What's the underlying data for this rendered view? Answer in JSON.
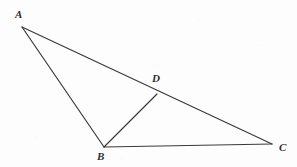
{
  "figure": {
    "kind": "geometry-diagram",
    "width": 297,
    "height": 167,
    "background_color": "#fdfdfd",
    "stroke_color": "#3a3a3a",
    "label_color": "#2e2e2e",
    "stroke_width": 1.2,
    "points": [
      {
        "id": "A",
        "label": "A",
        "x": 22,
        "y": 27,
        "label_x": 15,
        "label_y": 9
      },
      {
        "id": "B",
        "label": "B",
        "x": 104,
        "y": 147,
        "label_x": 97,
        "label_y": 151
      },
      {
        "id": "C",
        "label": "C",
        "x": 272,
        "y": 144,
        "label_x": 279,
        "label_y": 142
      },
      {
        "id": "D",
        "label": "D",
        "x": 157,
        "y": 94,
        "label_x": 152,
        "label_y": 73
      }
    ],
    "segments": [
      {
        "id": "AC",
        "from": "A",
        "to": "C",
        "name": "segment-ac"
      },
      {
        "id": "AB",
        "from": "A",
        "to": "B",
        "name": "segment-ab"
      },
      {
        "id": "BC",
        "from": "B",
        "to": "C",
        "name": "segment-bc"
      },
      {
        "id": "BD",
        "from": "B",
        "to": "D",
        "name": "segment-bd"
      }
    ]
  }
}
